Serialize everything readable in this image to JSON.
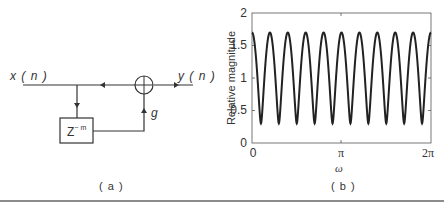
{
  "panel_a": {
    "caption": "( a )",
    "input_label": "x ( n )",
    "output_label": "y ( n )",
    "delay_label_base": "Z",
    "delay_label_exp": "− m",
    "gain_label": "g"
  },
  "panel_b": {
    "caption": "( b )"
  },
  "chart_data": {
    "type": "line",
    "title": "",
    "xlabel": "ω",
    "ylabel": "Relative magnitude",
    "xlim": [
      0,
      6.2832
    ],
    "ylim": [
      0,
      2
    ],
    "x_ticks": [
      "0",
      "π",
      "2π"
    ],
    "y_ticks": [
      "0",
      "0.5",
      "1",
      "1.5",
      "2"
    ],
    "grid": false,
    "series": [
      {
        "name": "|H(ω)| = |1 + g·e^{-jmω}|",
        "g": 0.7,
        "m": 10,
        "max": 1.7,
        "min": 0.3,
        "peaks_count": 11,
        "troughs_count": 10
      }
    ]
  }
}
